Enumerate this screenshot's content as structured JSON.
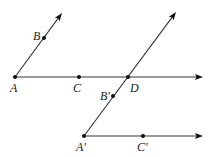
{
  "diagram": {
    "type": "geometry",
    "colors": {
      "line": "#333333",
      "point": "#111111",
      "label": "#222222",
      "background": "#ffffff"
    },
    "points": [
      {
        "id": "A",
        "label": "A",
        "x": 15,
        "y": 77,
        "lx": 10,
        "ly": 92
      },
      {
        "id": "B",
        "label": "B",
        "x": 44,
        "y": 38,
        "lx": 33,
        "ly": 40
      },
      {
        "id": "C",
        "label": "C",
        "x": 79,
        "y": 77,
        "lx": 73,
        "ly": 92
      },
      {
        "id": "D",
        "label": "D",
        "x": 128,
        "y": 77,
        "lx": 130,
        "ly": 92
      },
      {
        "id": "B2",
        "label": "B′",
        "x": 113,
        "y": 96,
        "lx": 100,
        "ly": 100
      },
      {
        "id": "A2",
        "label": "A′",
        "x": 84,
        "y": 136,
        "lx": 76,
        "ly": 151
      },
      {
        "id": "C2",
        "label": "C′",
        "x": 143,
        "y": 136,
        "lx": 137,
        "ly": 151
      }
    ],
    "rays": [
      {
        "id": "ray-AB",
        "from": "A",
        "through": "B",
        "x1": 15,
        "y1": 77,
        "x2": 62,
        "y2": 13
      },
      {
        "id": "ray-AC",
        "from": "A",
        "through": "C",
        "x1": 15,
        "y1": 77,
        "x2": 203,
        "y2": 77
      },
      {
        "id": "ray-A2B2",
        "from": "A′",
        "through": "B′",
        "x1": 84,
        "y1": 136,
        "x2": 176,
        "y2": 12
      },
      {
        "id": "ray-A2C2",
        "from": "A′",
        "through": "C′",
        "x1": 84,
        "y1": 136,
        "x2": 203,
        "y2": 136
      }
    ]
  }
}
